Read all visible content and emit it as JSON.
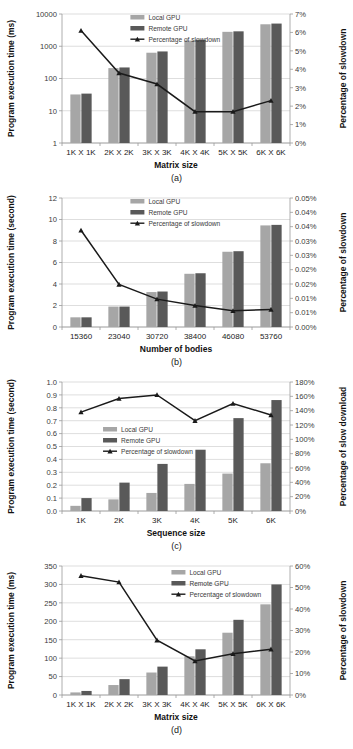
{
  "figure": {
    "captions": [
      "(a)",
      "(b)",
      "(c)",
      "(d)"
    ]
  },
  "series_names": {
    "local": "Local GPU",
    "remote": "Remote GPU",
    "line_slowdown": "Percentage of slowdown",
    "line_slow_download": "Percentage of slowdown"
  },
  "colors": {
    "local_gpu": "#a6a6a6",
    "remote_gpu": "#595959",
    "line": "#1a1a1a",
    "grid": "#c8c8c8",
    "axis": "#9a9a9a"
  },
  "chart_data": [
    {
      "id": "a",
      "type": "bar",
      "title": "",
      "caption": "(a)",
      "xlabel": "Matrix size",
      "ylabel": "Program execution time (ms)",
      "y2label": "Percentage of slowdown",
      "categories": [
        "1K X 1K",
        "2K X 2K",
        "3K X 3K",
        "4K X 4K",
        "5K X 5K",
        "6K X 6K"
      ],
      "yscale": "log",
      "ylim": [
        1,
        10000
      ],
      "yticks": [
        1,
        10,
        100,
        1000,
        10000
      ],
      "yticklabels": [
        "1",
        "10",
        "100",
        "1000",
        "10000"
      ],
      "y2lim": [
        0,
        7
      ],
      "y2ticks": [
        0,
        1,
        2,
        3,
        4,
        5,
        6,
        7
      ],
      "y2ticklabels": [
        "0%",
        "1%",
        "2%",
        "3%",
        "4%",
        "5%",
        "6%",
        "7%"
      ],
      "series": [
        {
          "name": "Local GPU",
          "values": [
            32,
            210,
            630,
            1500,
            2800,
            4800
          ]
        },
        {
          "name": "Remote GPU",
          "values": [
            34,
            220,
            690,
            1580,
            2900,
            5050
          ]
        }
      ],
      "line": {
        "name": "Percentage of slowdown",
        "values": [
          6.1,
          3.8,
          3.2,
          1.7,
          1.7,
          2.3
        ]
      },
      "grid": true,
      "legend_position": "top-center"
    },
    {
      "id": "b",
      "type": "bar",
      "title": "",
      "caption": "(b)",
      "xlabel": "Number of bodies",
      "ylabel": "Program execution time (second)",
      "y2label": "Percentage of slowdown",
      "categories": [
        "15360",
        "23040",
        "30720",
        "38400",
        "46080",
        "53760"
      ],
      "yscale": "linear",
      "ylim": [
        0,
        12
      ],
      "yticks": [
        0,
        2,
        4,
        6,
        8,
        10,
        12
      ],
      "yticklabels": [
        "0",
        "2",
        "4",
        "6",
        "8",
        "10",
        "12"
      ],
      "y2lim": [
        0,
        0.05
      ],
      "y2ticks": [
        0,
        0.005,
        0.01,
        0.015,
        0.02,
        0.025,
        0.03,
        0.035,
        0.04,
        0.045,
        0.05
      ],
      "y2ticklabels": [
        "0.00%",
        "0.01%",
        "0.01%",
        "0.02%",
        "0.02%",
        "0.03%",
        "0.03%",
        "0.04%",
        "0.04%",
        "0.05%"
      ],
      "series": [
        {
          "name": "Local GPU",
          "values": [
            0.9,
            1.9,
            3.25,
            4.95,
            7.0,
            9.45
          ]
        },
        {
          "name": "Remote GPU",
          "values": [
            0.9,
            1.9,
            3.3,
            5.0,
            7.05,
            9.5
          ]
        }
      ],
      "line": {
        "name": "Percentage of slowdown",
        "values": [
          0.0375,
          0.0165,
          0.0108,
          0.0083,
          0.0063,
          0.0068
        ]
      },
      "grid": true,
      "legend_position": "top-center"
    },
    {
      "id": "c",
      "type": "bar",
      "title": "",
      "caption": "(c)",
      "xlabel": "Sequence size",
      "ylabel": "Program execution time (second)",
      "y2label": "Percentage of slow download",
      "categories": [
        "1K",
        "2K",
        "3K",
        "4K",
        "5K",
        "6K"
      ],
      "yscale": "linear",
      "ylim": [
        0,
        1.0
      ],
      "yticks": [
        0,
        0.1,
        0.2,
        0.3,
        0.4,
        0.5,
        0.6,
        0.7,
        0.8,
        0.9,
        1.0
      ],
      "yticklabels": [
        "0.0",
        "0.1",
        "0.2",
        "0.3",
        "0.4",
        "0.5",
        "0.6",
        "0.7",
        "0.8",
        "0.9",
        "1.0"
      ],
      "y2lim": [
        0,
        180
      ],
      "y2ticks": [
        0,
        20,
        40,
        60,
        80,
        100,
        120,
        140,
        160,
        180
      ],
      "y2ticklabels": [
        "0%",
        "20%",
        "40%",
        "60%",
        "80%",
        "100%",
        "120%",
        "140%",
        "160%",
        "180%"
      ],
      "series": [
        {
          "name": "Local GPU",
          "values": [
            0.04,
            0.09,
            0.14,
            0.21,
            0.29,
            0.37
          ]
        },
        {
          "name": "Remote GPU",
          "values": [
            0.1,
            0.22,
            0.365,
            0.475,
            0.72,
            0.86
          ]
        }
      ],
      "line": {
        "name": "Percentage of slowdown",
        "values": [
          138,
          157,
          162,
          126,
          150,
          134
        ]
      },
      "grid": true,
      "legend_position": "center-left"
    },
    {
      "id": "d",
      "type": "bar",
      "title": "",
      "caption": "(d)",
      "xlabel": "Matrix size",
      "ylabel": "Program execution time (ms)",
      "y2label": "Percentage of slowdown",
      "categories": [
        "1K X 1K",
        "2K X 2K",
        "3K X 3K",
        "4K X 4K",
        "5K X 5K",
        "6K X 6K"
      ],
      "yscale": "linear",
      "ylim": [
        0,
        350
      ],
      "yticks": [
        0,
        50,
        100,
        150,
        200,
        250,
        300,
        350
      ],
      "yticklabels": [
        "0",
        "50",
        "100",
        "150",
        "200",
        "250",
        "300",
        "350"
      ],
      "y2lim": [
        0,
        60
      ],
      "y2ticks": [
        0,
        10,
        20,
        30,
        40,
        50,
        60
      ],
      "y2ticklabels": [
        "0%",
        "10%",
        "20%",
        "30%",
        "40%",
        "50%",
        "60%"
      ],
      "series": [
        {
          "name": "Local GPU",
          "values": [
            7,
            27,
            61,
            105,
            169,
            246
          ]
        },
        {
          "name": "Remote GPU",
          "values": [
            11,
            43,
            77,
            124,
            204,
            300
          ]
        }
      ],
      "line": {
        "name": "Percentage of slowdown",
        "values": [
          55.5,
          52.5,
          25.5,
          15.8,
          19.2,
          21.3
        ]
      },
      "grid": true,
      "legend_position": "top-right"
    }
  ]
}
